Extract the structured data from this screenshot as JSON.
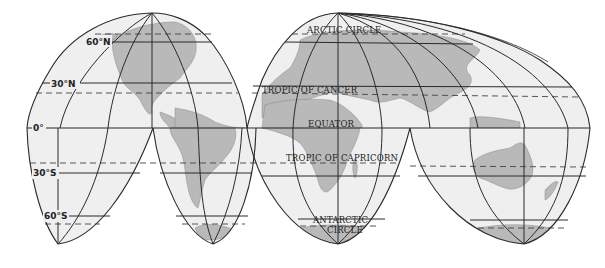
{
  "map": {
    "projection": "interrupted-homolosine",
    "colors": {
      "ocean": "#efefef",
      "land": "#b9b9b9",
      "grid": "#2a2a2a",
      "text": "#222222",
      "background": "#ffffff"
    },
    "latitude_labels": {
      "n60": "60°N",
      "n30": "30°N",
      "eq": "0°",
      "s30": "30°S",
      "s60": "60°S"
    },
    "circle_labels": {
      "arctic": "ARCTIC CIRCLE",
      "cancer": "TROPIC OF CANCER",
      "equator": "EQUATOR",
      "capricorn": "TROPIC OF CAPRICORN",
      "antarctic_line1": "ANTARCTIC",
      "antarctic_line2": "CIRCLE"
    }
  }
}
